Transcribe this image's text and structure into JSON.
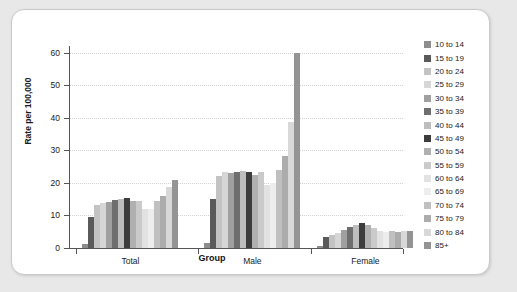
{
  "chart_data": {
    "type": "bar",
    "title": "",
    "xlabel": "Group",
    "ylabel": "Rate per 100,000",
    "ylim": [
      0,
      62
    ],
    "yticks": [
      0,
      10,
      20,
      30,
      40,
      50,
      60
    ],
    "grid": true,
    "legend_position": "right",
    "categories": [
      "Total",
      "Male",
      "Female"
    ],
    "series": [
      {
        "name": "10 to 14",
        "color": "#8d8d8d",
        "values": [
          1.1,
          1.6,
          0.6
        ]
      },
      {
        "name": "15 to 19",
        "color": "#5a5a5a",
        "values": [
          9.4,
          15.1,
          3.4
        ]
      },
      {
        "name": "20 to 24",
        "color": "#c3c3c3",
        "values": [
          13.2,
          22.2,
          4.1
        ]
      },
      {
        "name": "25 to 29",
        "color": "#d6d6d6",
        "values": [
          13.9,
          23.3,
          4.5
        ]
      },
      {
        "name": "30 to 34",
        "color": "#a0a0a0",
        "values": [
          14.1,
          23.1,
          5.4
        ]
      },
      {
        "name": "35 to 39",
        "color": "#6e6e6e",
        "values": [
          14.8,
          23.4,
          6.4
        ]
      },
      {
        "name": "40 to 44",
        "color": "#bdbdbd",
        "values": [
          15.1,
          23.6,
          7.0
        ]
      },
      {
        "name": "45 to 49",
        "color": "#3c3c3c",
        "values": [
          15.2,
          23.2,
          7.6
        ]
      },
      {
        "name": "50 to 54",
        "color": "#b0b0b0",
        "values": [
          14.5,
          22.4,
          7.0
        ]
      },
      {
        "name": "55 to 59",
        "color": "#cacaca",
        "values": [
          14.3,
          23.2,
          6.2
        ]
      },
      {
        "name": "60 to 64",
        "color": "#e2e2e2",
        "values": [
          11.9,
          19.2,
          5.2
        ]
      },
      {
        "name": "65 to 69",
        "color": "#ededed",
        "values": [
          12.1,
          20.1,
          5.0
        ]
      },
      {
        "name": "70 to 74",
        "color": "#c0c0c0",
        "values": [
          14.4,
          24.0,
          5.1
        ]
      },
      {
        "name": "75 to 79",
        "color": "#acacac",
        "values": [
          16.1,
          28.2,
          5.0
        ]
      },
      {
        "name": "80 to 84",
        "color": "#d8d8d8",
        "values": [
          18.6,
          38.7,
          5.2
        ]
      },
      {
        "name": "85+",
        "color": "#949494",
        "values": [
          21.0,
          59.8,
          5.1
        ]
      }
    ]
  },
  "legend": {
    "items": [
      {
        "label": "10 to 14"
      },
      {
        "label": "15 to 19"
      },
      {
        "label": "20 to 24"
      },
      {
        "label": "25 to 29"
      },
      {
        "label": "30 to 34"
      },
      {
        "label": "35 to 39"
      },
      {
        "label": "40 to 44"
      },
      {
        "label": "45 to 49"
      },
      {
        "label": "50 to 54"
      },
      {
        "label": "55 to 59"
      },
      {
        "label": "60 to 64"
      },
      {
        "label": "65 to 69"
      },
      {
        "label": "70 to 74"
      },
      {
        "label": "75 to 79"
      },
      {
        "label": "80 to 84"
      },
      {
        "label": "85+"
      }
    ]
  }
}
